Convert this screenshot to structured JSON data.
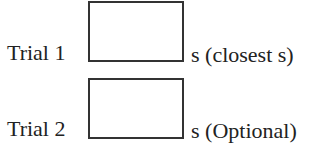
{
  "rows": [
    {
      "label": "Trial 1",
      "value": "",
      "unit": "s (closest s)"
    },
    {
      "label": "Trial 2",
      "value": "",
      "unit": "s (Optional)"
    }
  ]
}
